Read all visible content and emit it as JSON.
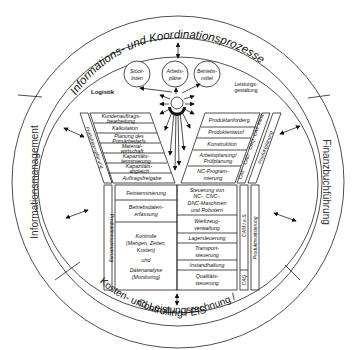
{
  "diagram": {
    "outer_ring": {
      "top": "Informations- und Koordinationsprozesse",
      "left": "Informationsmanagement",
      "right": "Finanzbuchführung",
      "bottom_line1": "Kosten- und Leistungsrechnung /",
      "bottom_line2": "Controlling / EIS"
    },
    "headers": {
      "logistik": "Logistik",
      "leistung_line1": "Leistungs-",
      "leistung_line2": "gestaltung"
    },
    "circles": [
      {
        "line1": "Stück-",
        "line2": "listen"
      },
      {
        "line1": "Arbeits-",
        "line2": "pläne"
      },
      {
        "line1": "Betriebs-",
        "line2": "mittel"
      }
    ],
    "left_column": [
      {
        "line1": "Kundenauftrags-",
        "line2": "bearbeitung"
      },
      {
        "line1": "Kalkulation",
        "line2": ""
      },
      {
        "line1": "Planung des",
        "line2": "Primärbedarfs"
      },
      {
        "line1": "Material-",
        "line2": "wirtschaft"
      },
      {
        "line1": "Kapazitäts-",
        "line2": "terminierung"
      },
      {
        "line1": "Kapazitäts-",
        "line2": "abgleich"
      },
      {
        "line1": "Auftragsfreigabe",
        "line2": ""
      }
    ],
    "right_column": [
      {
        "line1": "Produktanforderg.",
        "line2": ""
      },
      {
        "line1": "Produktentwurf",
        "line2": ""
      },
      {
        "line1": "Konstruktion",
        "line2": ""
      },
      {
        "line1": "Arbeitsplanung/",
        "line2": "Prüfplanung"
      },
      {
        "line1": "NC-Program-",
        "line2": "mierung"
      }
    ],
    "lower_left": [
      {
        "lines": [
          "Feinterminierung"
        ]
      },
      {
        "lines": [
          "Betriebsdaten-",
          "erfassung"
        ]
      },
      {
        "lines": [
          "Kontrolle",
          "(Mengen, Zeiten,",
          "Kosten)",
          "und",
          "Datenanalyse",
          "(Monitoring)"
        ]
      }
    ],
    "lower_right": [
      {
        "lines": [
          "Steuerung von",
          "NC-, CNC-,",
          "DNC-Maschinen",
          "und Robotern"
        ]
      },
      {
        "lines": [
          "Werkzeug-",
          "verwaltung"
        ]
      },
      {
        "lines": [
          "Lagersteuerung"
        ]
      },
      {
        "lines": [
          "Transport-",
          "steuerung"
        ]
      },
      {
        "lines": [
          "Instandhaltung"
        ]
      },
      {
        "lines": [
          "Qualitäts-",
          "steuerung"
        ]
      }
    ],
    "left_strips": {
      "upper": "Produktionsplanung",
      "lower": "Produktionssteuerung"
    },
    "right_strips": {
      "cax": [
        "CAE",
        "CAD",
        "CAQ",
        "CAE Varia."
      ],
      "upper": "Produktplanung",
      "cam": "CAM i.e.S.",
      "caq": "CAQ",
      "lower": "Produktrealisierung"
    }
  }
}
